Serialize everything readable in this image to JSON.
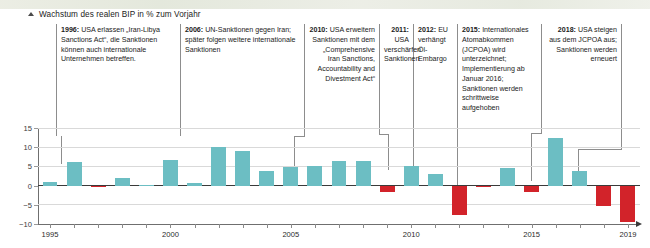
{
  "figure": {
    "axis_title": "Wachstum des realen BIP in % zum Vorjahr",
    "arrow_icon": "up-arrow-icon",
    "xaxis_arrow_icon": "right-arrow-icon"
  },
  "annotations": [
    {
      "id": "1996",
      "year_label": "1996:",
      "text": " USA erlassen „Iran-Libya Sanctions Act“, die Sanktionen können auch internationale Unternehmen betreffen.",
      "align": "left"
    },
    {
      "id": "2006",
      "year_label": "2006:",
      "text": " UN-Sanktionen gegen Iran; später folgen weitere internationale Sanktionen",
      "align": "left"
    },
    {
      "id": "2010",
      "year_label": "2010:",
      "text": " USA erweitern Sanktionen mit dem „Comprehensive Iran Sanctions, Accountability and Divestment Act“",
      "align": "right"
    },
    {
      "id": "2011",
      "year_label": "2011:",
      "text": " USA verschärfen Sanktionen",
      "align": "right"
    },
    {
      "id": "2012",
      "year_label": "2012:",
      "text": " EU verhängt Öl-Embargo",
      "align": "left"
    },
    {
      "id": "2015",
      "year_label": "2015:",
      "text": " Internationales Atomabkommen (JCPOA) wird unterzeichnet; Implementierung ab Januar 2016; Sanktionen werden schrittweise aufgehoben",
      "align": "left"
    },
    {
      "id": "2018",
      "year_label": "2018:",
      "text": " USA steigen aus dem JCPOA aus; Sanktionen werden erneuert",
      "align": "right"
    }
  ],
  "colors": {
    "positive_bar": "#6cbec3",
    "negative_bar": "#d2232a",
    "gridline": "#d9d9d9",
    "axis": "#3a3a3a"
  },
  "chart_data": {
    "type": "bar",
    "title": "Wachstum des realen BIP in % zum Vorjahr",
    "xlabel": "",
    "ylabel": "",
    "ylim": [
      -10,
      15
    ],
    "yticks": [
      15,
      10,
      5,
      0,
      -5,
      -10
    ],
    "ytick_labels": [
      "15",
      "10",
      "5",
      "0",
      "−5",
      "−10"
    ],
    "xticks": [
      1995,
      2000,
      2005,
      2010,
      2015,
      2019
    ],
    "xtick_labels": [
      "1995",
      "2000",
      "2005",
      "2010",
      "2015",
      "2019"
    ],
    "grid": true,
    "legend": null,
    "categories": [
      "1995",
      "1996",
      "1997",
      "1998",
      "1999",
      "2000",
      "2001",
      "2002",
      "2003",
      "2004",
      "2005",
      "2006",
      "2007",
      "2008",
      "2009",
      "2010",
      "2011",
      "2012",
      "2013",
      "2014",
      "2015",
      "2016",
      "2017",
      "2018",
      "2019"
    ],
    "values": [
      1.0,
      6.1,
      -0.4,
      1.9,
      0.2,
      6.7,
      0.6,
      10.0,
      9.0,
      3.8,
      4.9,
      5.0,
      6.4,
      6.5,
      -1.7,
      5.0,
      3.0,
      -7.7,
      -0.4,
      4.5,
      -1.6,
      12.5,
      3.7,
      -5.4,
      -9.5
    ]
  }
}
